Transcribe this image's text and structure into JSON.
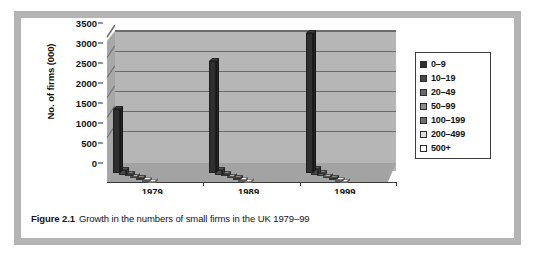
{
  "figure": {
    "caption_label": "Figure 2.1",
    "caption_text": "Growth in the numbers of small firms in the UK 1979–99"
  },
  "colors": {
    "frame": "#b4b4b4",
    "card": "#ffffff",
    "plot_wall": "#b6b6b6",
    "plot_floor": "#a3a3a3",
    "gridline": "#6b6b6b",
    "axis": "#3a3a3a",
    "text": "#111111"
  },
  "chart_data": {
    "type": "bar",
    "title": "",
    "subtitle": "",
    "xlabel": "Year",
    "ylabel": "No. of firms (000)",
    "categories": [
      "1979",
      "1989",
      "1999"
    ],
    "ylim": [
      0,
      3500
    ],
    "yticks": [
      0,
      500,
      1000,
      1500,
      2000,
      2500,
      3000,
      3500
    ],
    "ytick_labels": [
      "0",
      "500",
      "1000",
      "1500",
      "2000",
      "2500",
      "3000",
      "3500"
    ],
    "grid": true,
    "legend_position": "right",
    "three_d": true,
    "series": [
      {
        "name": "0–9",
        "color": "#2f2f2f",
        "values": [
          1590,
          2800,
          3500
        ]
      },
      {
        "name": "10–19",
        "color": "#4a4a4a",
        "values": [
          130,
          120,
          140
        ]
      },
      {
        "name": "20–49",
        "color": "#6a6a6a",
        "values": [
          70,
          70,
          80
        ]
      },
      {
        "name": "50–99",
        "color": "#8e8e8e",
        "values": [
          35,
          35,
          40
        ]
      },
      {
        "name": "100–199",
        "color": "#6f6f6f",
        "values": [
          20,
          20,
          22
        ]
      },
      {
        "name": "200–499",
        "color": "#dcdcdc",
        "values": [
          12,
          12,
          14
        ]
      },
      {
        "name": "500+",
        "color": "#ffffff",
        "values": [
          6,
          6,
          7
        ]
      }
    ]
  },
  "legend": {
    "items": [
      {
        "label": "0–9",
        "swatch": "#2f2f2f"
      },
      {
        "label": "10–19",
        "swatch": "#4a4a4a"
      },
      {
        "label": "20–49",
        "swatch": "#6a6a6a"
      },
      {
        "label": "50–99",
        "swatch": "#8e8e8e"
      },
      {
        "label": "100–199",
        "swatch": "#6f6f6f"
      },
      {
        "label": "200–499",
        "swatch": "#dcdcdc"
      },
      {
        "label": "500+",
        "swatch": "#ffffff"
      }
    ]
  }
}
